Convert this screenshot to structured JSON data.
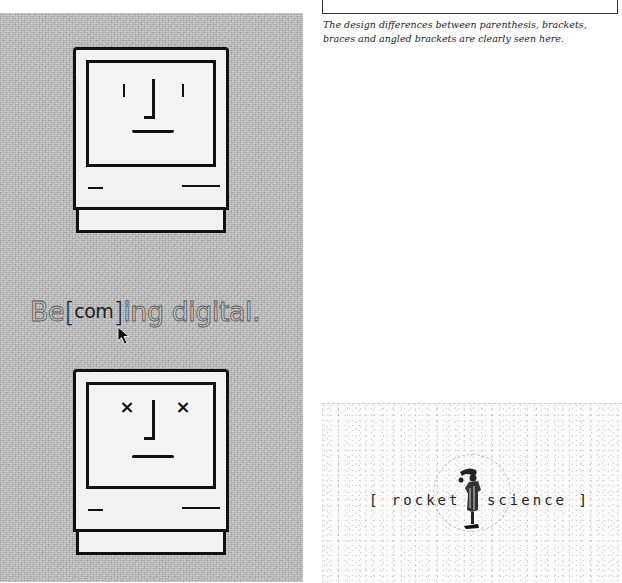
{
  "caption": {
    "text": "The design differences between parenthesis, brackets, braces and angled brackets are clearly seen here."
  },
  "left_panel": {
    "top_mac": {
      "expression": "happy",
      "eyes": "vertical-lines",
      "mouth": "smile"
    },
    "tagline": {
      "prefix": "Be",
      "open_bracket": "[",
      "inner": "com",
      "close_bracket": "]",
      "suffix": "ing digital."
    },
    "bottom_mac": {
      "expression": "sad",
      "eyes": "x",
      "left_eye_glyph": "×",
      "right_eye_glyph": "×",
      "mouth": "flat"
    }
  },
  "rocket_panel": {
    "left_text": "[ rocket",
    "right_text": "science ]",
    "icon": "scientist-figure-icon"
  },
  "colors": {
    "panel_gray": "#b4b4b4",
    "ink": "#111111",
    "tagline_fill": "#c9c9c9"
  }
}
